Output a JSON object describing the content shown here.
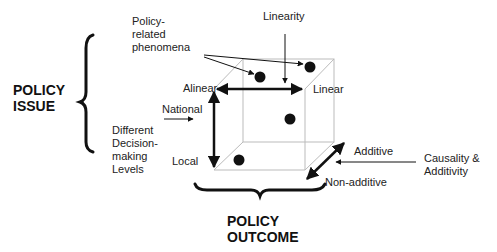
{
  "diagram": {
    "labels": {
      "policy_issue": "POLICY\nISSUE",
      "policy_outcome": "POLICY\nOUTCOME",
      "policy_related_phenomena": "Policy-\nrelated\nphenomena",
      "linearity": "Linearity",
      "alinear": "Alinear",
      "linear": "Linear",
      "national": "National",
      "local": "Local",
      "decision_levels": "Different\nDecision-\nmaking\nLevels",
      "additive": "Additive",
      "non_additive": "Non-additive",
      "causality_additivity": "Causality &\nAdditivity"
    },
    "axes": [
      {
        "name": "Linearity",
        "from": "Alinear",
        "to": "Linear"
      },
      {
        "name": "Different Decision-making Levels",
        "from": "National",
        "to": "Local"
      },
      {
        "name": "Causality & Additivity",
        "from": "Additive",
        "to": "Non-additive"
      }
    ],
    "colors": {
      "stroke": "#111111",
      "cube_edge": "#bbbbbb",
      "background": "#ffffff"
    }
  }
}
